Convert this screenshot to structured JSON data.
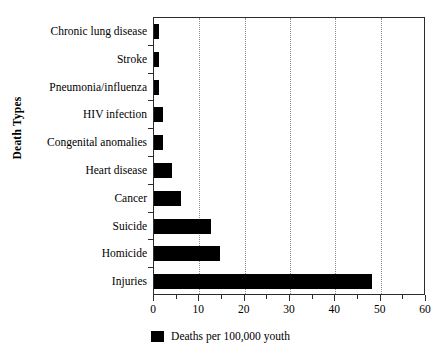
{
  "chart_data": {
    "type": "bar",
    "orientation": "horizontal",
    "title": "",
    "xlabel": "",
    "ylabel": "Death Types",
    "categories": [
      "Chronic lung disease",
      "Stroke",
      "Pneumonia/influenza",
      "HIV infection",
      "Congenital anomalies",
      "Heart disease",
      "Cancer",
      "Suicide",
      "Homicide",
      "Injuries"
    ],
    "values": [
      1,
      1,
      1,
      2,
      2,
      4,
      6,
      12.5,
      14.5,
      48
    ],
    "series": [
      {
        "name": "Deaths per 100,000 youth",
        "values": [
          1,
          1,
          1,
          2,
          2,
          4,
          6,
          12.5,
          14.5,
          48
        ],
        "color": "#000000"
      }
    ],
    "xlim": [
      0,
      60
    ],
    "xticks": [
      0,
      10,
      20,
      30,
      40,
      50,
      60
    ],
    "xtick_labels": [
      "0",
      "10",
      "20",
      "30",
      "40",
      "50",
      "60"
    ],
    "xminorticks": [
      5,
      15,
      25,
      35,
      45,
      55
    ],
    "gridlines": [
      10,
      20,
      30,
      40,
      50
    ],
    "grid": true,
    "grid_style": "dotted",
    "grid_color": "#8d8d8d",
    "legend": {
      "position": "bottom-center",
      "entries": [
        {
          "label": "Deaths per 100,000 youth",
          "color": "#000000",
          "marker": "square"
        }
      ]
    },
    "frame": true,
    "background_color": "#ffffff",
    "axis_color": "#2b2b2b"
  }
}
